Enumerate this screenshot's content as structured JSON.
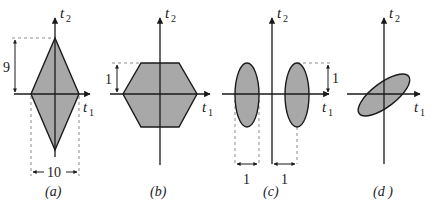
{
  "figure": {
    "fill_color": "#a8a8a8",
    "line_color": "#1a1a1a",
    "dash_color": "#8c8c8c",
    "axis_labels": {
      "x": "t",
      "x_sub": "1",
      "y": "t",
      "y_sub": "2"
    },
    "panels": [
      {
        "id": "a",
        "caption": "(a)",
        "shape": "diamond",
        "dimensions": {
          "height_label": "9",
          "width_label": "10"
        }
      },
      {
        "id": "b",
        "caption": "(b)",
        "shape": "hexagon",
        "dimensions": {
          "height_label": "1"
        }
      },
      {
        "id": "c",
        "caption": "(c)",
        "shape": "two-vertical-ellipses",
        "dimensions": {
          "left_width_label": "1",
          "offset_label": "1",
          "height_label": "1"
        }
      },
      {
        "id": "d",
        "caption": "(d )",
        "shape": "tilted-ellipse"
      }
    ]
  }
}
